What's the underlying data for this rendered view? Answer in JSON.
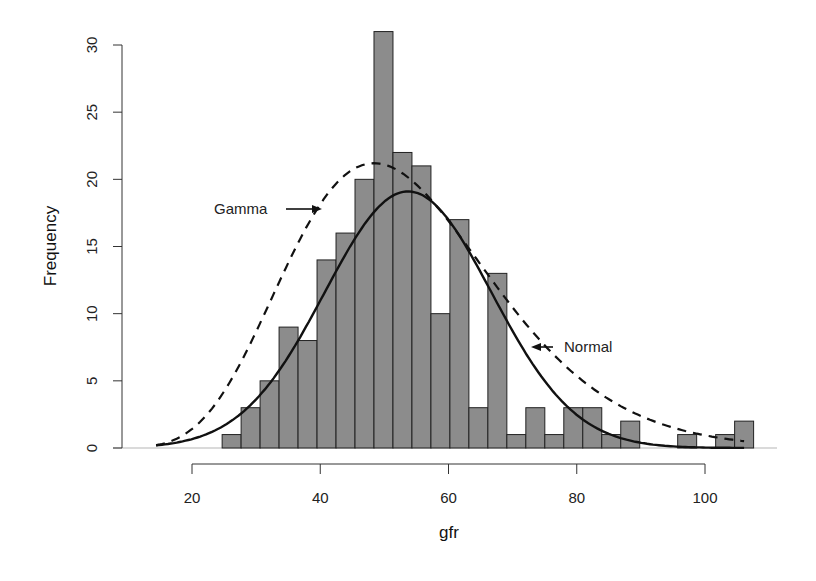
{
  "chart_data": {
    "type": "bar",
    "subtype": "histogram",
    "title": "",
    "xlabel": "gfr",
    "ylabel": "Frequency",
    "xlim": [
      12,
      113
    ],
    "ylim": [
      0,
      31
    ],
    "xticks": [
      20,
      40,
      60,
      80,
      100
    ],
    "yticks": [
      0,
      5,
      10,
      15,
      20,
      25,
      30
    ],
    "grid": false,
    "bin_start": 24.7,
    "bin_width": 2.96,
    "bins": [
      [
        24.7,
        27.66
      ],
      [
        27.66,
        30.62
      ],
      [
        30.62,
        33.58
      ],
      [
        33.58,
        36.54
      ],
      [
        36.54,
        39.5
      ],
      [
        39.5,
        42.46
      ],
      [
        42.46,
        45.42
      ],
      [
        45.42,
        48.38
      ],
      [
        48.38,
        51.34
      ],
      [
        51.34,
        54.3
      ],
      [
        54.3,
        57.26
      ],
      [
        57.26,
        60.22
      ],
      [
        60.22,
        63.18
      ],
      [
        63.18,
        66.14
      ],
      [
        66.14,
        69.1
      ],
      [
        69.1,
        72.06
      ],
      [
        72.06,
        75.02
      ],
      [
        75.02,
        77.98
      ],
      [
        77.98,
        80.94
      ],
      [
        80.94,
        83.9
      ],
      [
        83.9,
        86.86
      ],
      [
        86.86,
        89.82
      ],
      [
        89.82,
        92.78
      ],
      [
        92.78,
        95.74
      ],
      [
        95.74,
        98.7
      ],
      [
        98.7,
        101.66
      ],
      [
        101.66,
        104.62
      ],
      [
        104.62,
        107.58
      ]
    ],
    "values": [
      1,
      3,
      5,
      9,
      8,
      14,
      16,
      20,
      31,
      22,
      21,
      10,
      17,
      3,
      13,
      1,
      3,
      1,
      3,
      3,
      1,
      2,
      0,
      0,
      1,
      0,
      1,
      2
    ],
    "bar_color": "#8c8c8c",
    "series": [
      {
        "name": "Normal",
        "style": "solid",
        "color": "#111111",
        "distribution": "normal",
        "mean": 53.7,
        "sd": 13.0,
        "peak": 19.1,
        "x_range": [
          14.4,
          106.1
        ]
      },
      {
        "name": "Gamma",
        "style": "dashed",
        "color": "#111111",
        "distribution": "gamma",
        "shape": 10.13,
        "scale": 5.3,
        "peak": 21.2,
        "x_range": [
          14.4,
          106.1
        ]
      }
    ],
    "annotations": [
      {
        "text": "Gamma",
        "arrow": "right",
        "x": 27,
        "y": 17.6
      },
      {
        "text": "Normal",
        "arrow": "left",
        "x": 82,
        "y": 7.5
      }
    ],
    "legend": "none"
  }
}
